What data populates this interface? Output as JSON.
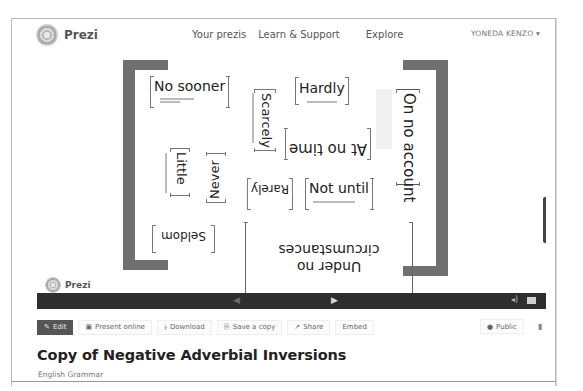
{
  "header": {
    "logo_text": "Prezi",
    "nav": [
      {
        "label": "Your prezis"
      },
      {
        "label": "Learn & Support"
      },
      {
        "label": "Explore"
      }
    ],
    "user": "YONEDA KENZO",
    "user_caret": "▾"
  },
  "canvas": {
    "words": [
      {
        "text": "No sooner"
      },
      {
        "text": "Scarcely"
      },
      {
        "text": "Hardly"
      },
      {
        "text": "On no account"
      },
      {
        "text": "At no time"
      },
      {
        "text": "Little"
      },
      {
        "text": "Never"
      },
      {
        "text": "Rarely"
      },
      {
        "text": "Not until"
      },
      {
        "text": "Seldom"
      },
      {
        "text": "Under no circumstances"
      }
    ],
    "zoom_controls": {
      "home": "⌂",
      "zoom_in": "+",
      "zoom_out": "−"
    },
    "logo_text": "Prezi"
  },
  "player": {
    "prev": "◀",
    "next": "▶",
    "volume": "🔈",
    "fullscreen": "fullscreen"
  },
  "toolbar": {
    "edit": "Edit",
    "present_online": "Present online",
    "download": "Download",
    "save_copy": "Save a copy",
    "share": "Share",
    "embed": "Embed",
    "public": "Public",
    "icons": {
      "edit": "✎",
      "present": "▣",
      "download": "⤓",
      "save": "⎘",
      "share": "↗",
      "public": "●",
      "trash": "🗑"
    }
  },
  "presentation": {
    "title": "Copy of Negative Adverbial Inversions",
    "subtitle": "English Grammar"
  }
}
